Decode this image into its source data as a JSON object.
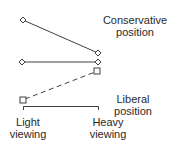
{
  "diagram": {
    "labels": {
      "conservative": {
        "line1": "Conservative",
        "line2": "position"
      },
      "liberal": {
        "line1": "Liberal",
        "line2": "position"
      },
      "light_viewing": {
        "line1": "Light",
        "line2": "viewing"
      },
      "heavy_viewing": {
        "line1": "Heavy",
        "line2": "viewing"
      }
    },
    "series": [
      {
        "name": "Series 1 (diamond, solid)",
        "marker": "diamond",
        "line_style": "solid",
        "points": [
          {
            "x": "Light viewing",
            "y_px": 20
          },
          {
            "x": "Heavy viewing",
            "y_px": 53
          }
        ]
      },
      {
        "name": "Series 2 (diamond, solid)",
        "marker": "diamond",
        "line_style": "solid",
        "points": [
          {
            "x": "Light viewing",
            "y_px": 62
          },
          {
            "x": "Heavy viewing",
            "y_px": 62
          }
        ]
      },
      {
        "name": "Series 3 (square, dashed)",
        "marker": "square",
        "line_style": "dashed",
        "points": [
          {
            "x": "Light viewing",
            "y_px": 100
          },
          {
            "x": "Heavy viewing",
            "y_px": 71
          }
        ]
      }
    ],
    "axis": {
      "y_top_meaning": "Conservative position",
      "y_bottom_meaning": "Liberal position",
      "x_categories": [
        "Light viewing",
        "Heavy viewing"
      ]
    },
    "colors": {
      "ink": "#2a2a2a",
      "background": "#ffffff"
    }
  }
}
